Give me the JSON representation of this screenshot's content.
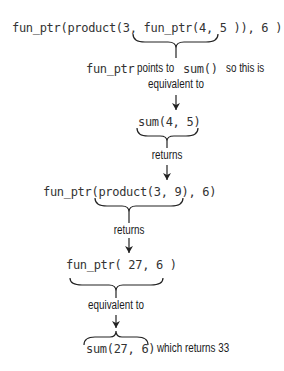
{
  "diagram": {
    "step1_expression": "fun_ptr(product(3, fun_ptr(4, 5 )), 6 )",
    "step1_note_code1": "fun_ptr",
    "step1_note_text1": "points to",
    "step1_note_code2": "sum()",
    "step1_note_text2": "so this is",
    "step1_note_line2": "equivalent to",
    "step2_expression": "sum(4, 5)",
    "step2_label": "returns",
    "step3_expression": "fun_ptr(product(3, 9), 6)",
    "step3_label": "returns",
    "step4_expression": "fun_ptr( 27, 6 )",
    "step4_label": "equivalent to",
    "step5_expression": "sum(27, 6)",
    "step5_result": "which returns 33"
  },
  "colors": {
    "text": "#1a1a1a",
    "code": "#333333",
    "lines": "#222222",
    "background": "#ffffff"
  }
}
